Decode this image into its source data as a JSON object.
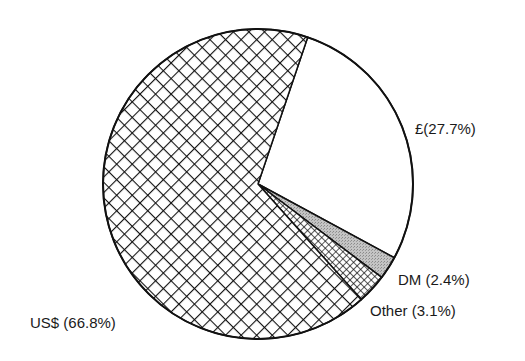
{
  "chart_data": {
    "type": "pie",
    "title": "",
    "categories": [
      "£",
      "DM",
      "Other",
      "US$"
    ],
    "values": [
      27.7,
      2.4,
      3.1,
      66.8
    ],
    "unit": "%",
    "labels": [
      "£(27.7%)",
      "DM (2.4%)",
      "Other (3.1%)",
      "US$ (66.8%)"
    ],
    "fills": [
      "blank",
      "grey-stipple",
      "fine-checker",
      "diagonal-crosshatch"
    ],
    "start_angle_deg_clockwise_from_top": 18.7,
    "legend": "none (direct labels)"
  },
  "slices": [
    {
      "name": "£",
      "value": 27.7,
      "label": "£(27.7%)",
      "pattern": "none",
      "label_x": 415,
      "label_y": 121
    },
    {
      "name": "DM",
      "value": 2.4,
      "label": "DM (2.4%)",
      "pattern": "stipple",
      "label_x": 398,
      "label_y": 272
    },
    {
      "name": "Other",
      "value": 3.1,
      "label": "Other (3.1%)",
      "pattern": "checker",
      "label_x": 370,
      "label_y": 303
    },
    {
      "name": "US$",
      "value": 66.8,
      "label": "US$ (66.8%)",
      "pattern": "crosshatch",
      "label_x": 30,
      "label_y": 315
    }
  ],
  "colors": {
    "stroke": "#111111",
    "stipple": "#b5b5b5",
    "background": "#ffffff"
  }
}
